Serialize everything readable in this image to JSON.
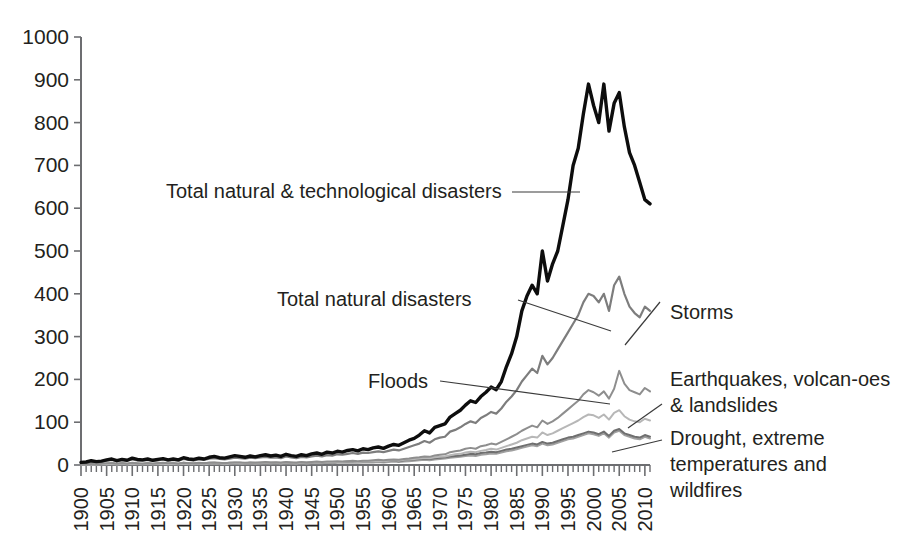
{
  "chart_data": {
    "type": "line",
    "title": "",
    "xlabel": "",
    "ylabel": "",
    "ylim": [
      0,
      1000
    ],
    "xlim": [
      1900,
      2011
    ],
    "grid": false,
    "legend_position": "inline-annotations",
    "ytick_labels": [
      "0",
      "100",
      "200",
      "300",
      "400",
      "500",
      "600",
      "700",
      "800",
      "900",
      "1000"
    ],
    "ytick_values": [
      0,
      100,
      200,
      300,
      400,
      500,
      600,
      700,
      800,
      900,
      1000
    ],
    "xtick_labels": [
      "1900",
      "1905",
      "1910",
      "1915",
      "1920",
      "1925",
      "1930",
      "1935",
      "1940",
      "1945",
      "1950",
      "1955",
      "1960",
      "1965",
      "1970",
      "1975",
      "1980",
      "1985",
      "1990",
      "1995",
      "2000",
      "2005",
      "2010"
    ],
    "xtick_values": [
      1900,
      1905,
      1910,
      1915,
      1920,
      1925,
      1930,
      1935,
      1940,
      1945,
      1950,
      1955,
      1960,
      1965,
      1970,
      1975,
      1980,
      1985,
      1990,
      1995,
      2000,
      2005,
      2010
    ],
    "x": [
      1900,
      1901,
      1902,
      1903,
      1904,
      1905,
      1906,
      1907,
      1908,
      1909,
      1910,
      1911,
      1912,
      1913,
      1914,
      1915,
      1916,
      1917,
      1918,
      1919,
      1920,
      1921,
      1922,
      1923,
      1924,
      1925,
      1926,
      1927,
      1928,
      1929,
      1930,
      1931,
      1932,
      1933,
      1934,
      1935,
      1936,
      1937,
      1938,
      1939,
      1940,
      1941,
      1942,
      1943,
      1944,
      1945,
      1946,
      1947,
      1948,
      1949,
      1950,
      1951,
      1952,
      1953,
      1954,
      1955,
      1956,
      1957,
      1958,
      1959,
      1960,
      1961,
      1962,
      1963,
      1964,
      1965,
      1966,
      1967,
      1968,
      1969,
      1970,
      1971,
      1972,
      1973,
      1974,
      1975,
      1976,
      1977,
      1978,
      1979,
      1980,
      1981,
      1982,
      1983,
      1984,
      1985,
      1986,
      1987,
      1988,
      1989,
      1990,
      1991,
      1992,
      1993,
      1994,
      1995,
      1996,
      1997,
      1998,
      1999,
      2000,
      2001,
      2002,
      2003,
      2004,
      2005,
      2006,
      2007,
      2008,
      2009,
      2010,
      2011
    ],
    "series": [
      {
        "name": "Total natural & technological disasters",
        "color": "#0d0d0d",
        "width": 3.4,
        "values": [
          6,
          7,
          10,
          8,
          9,
          12,
          14,
          10,
          13,
          11,
          16,
          13,
          12,
          14,
          11,
          13,
          15,
          12,
          14,
          12,
          17,
          14,
          13,
          16,
          14,
          18,
          20,
          17,
          16,
          19,
          22,
          20,
          18,
          21,
          19,
          22,
          24,
          21,
          23,
          20,
          25,
          22,
          20,
          24,
          22,
          26,
          28,
          25,
          30,
          28,
          32,
          30,
          34,
          36,
          33,
          38,
          36,
          40,
          42,
          39,
          44,
          48,
          46,
          52,
          58,
          62,
          70,
          80,
          75,
          88,
          92,
          96,
          112,
          120,
          128,
          140,
          150,
          146,
          160,
          170,
          182,
          176,
          195,
          230,
          260,
          300,
          360,
          395,
          420,
          400,
          500,
          430,
          470,
          500,
          560,
          620,
          700,
          740,
          820,
          890,
          840,
          800,
          890,
          780,
          845,
          870,
          790,
          730,
          700,
          660,
          620,
          610
        ]
      },
      {
        "name": "Total natural disasters",
        "color": "#7d7d7d",
        "width": 2.2,
        "values": [
          5,
          6,
          8,
          7,
          8,
          10,
          12,
          9,
          11,
          10,
          13,
          11,
          10,
          12,
          10,
          11,
          13,
          10,
          12,
          10,
          14,
          12,
          11,
          13,
          12,
          15,
          16,
          14,
          13,
          15,
          17,
          16,
          15,
          17,
          16,
          18,
          19,
          17,
          18,
          16,
          20,
          18,
          16,
          19,
          18,
          20,
          22,
          20,
          23,
          22,
          25,
          24,
          26,
          28,
          26,
          29,
          28,
          30,
          32,
          30,
          33,
          36,
          34,
          38,
          42,
          46,
          50,
          56,
          52,
          60,
          64,
          66,
          78,
          82,
          88,
          96,
          102,
          98,
          110,
          116,
          124,
          120,
          132,
          148,
          160,
          175,
          195,
          210,
          225,
          215,
          255,
          235,
          250,
          270,
          290,
          310,
          330,
          350,
          380,
          400,
          395,
          380,
          400,
          360,
          420,
          440,
          400,
          370,
          355,
          345,
          370,
          360
        ]
      },
      {
        "name": "Floods",
        "color": "#8e8e8e",
        "width": 2.0,
        "values": [
          2,
          2,
          3,
          2,
          3,
          4,
          4,
          3,
          4,
          3,
          5,
          4,
          3,
          4,
          3,
          4,
          5,
          4,
          4,
          3,
          5,
          4,
          4,
          5,
          4,
          5,
          6,
          5,
          4,
          5,
          6,
          6,
          5,
          6,
          5,
          6,
          7,
          6,
          6,
          5,
          7,
          6,
          5,
          7,
          6,
          7,
          8,
          7,
          8,
          8,
          9,
          8,
          9,
          10,
          9,
          10,
          10,
          11,
          12,
          11,
          12,
          13,
          12,
          14,
          15,
          17,
          18,
          20,
          19,
          22,
          24,
          25,
          30,
          32,
          34,
          38,
          40,
          38,
          44,
          46,
          50,
          48,
          54,
          60,
          66,
          72,
          80,
          86,
          92,
          88,
          104,
          96,
          102,
          110,
          120,
          130,
          140,
          150,
          165,
          175,
          170,
          162,
          172,
          155,
          178,
          220,
          190,
          175,
          170,
          165,
          180,
          172
        ]
      },
      {
        "name": "Storms",
        "color": "#b7b7b7",
        "width": 2.0,
        "values": [
          1,
          1,
          2,
          1,
          2,
          2,
          3,
          2,
          3,
          2,
          3,
          3,
          2,
          3,
          2,
          3,
          3,
          2,
          3,
          2,
          4,
          3,
          3,
          4,
          3,
          4,
          4,
          4,
          3,
          4,
          5,
          4,
          4,
          5,
          4,
          5,
          5,
          5,
          5,
          4,
          6,
          5,
          4,
          5,
          5,
          6,
          6,
          6,
          7,
          6,
          7,
          7,
          8,
          8,
          7,
          8,
          8,
          9,
          9,
          9,
          10,
          11,
          10,
          12,
          13,
          14,
          15,
          17,
          16,
          18,
          19,
          20,
          23,
          25,
          26,
          29,
          31,
          30,
          33,
          35,
          38,
          36,
          40,
          44,
          48,
          52,
          58,
          62,
          66,
          64,
          76,
          70,
          74,
          80,
          86,
          92,
          98,
          104,
          112,
          118,
          116,
          110,
          118,
          106,
          122,
          128,
          114,
          106,
          102,
          100,
          108,
          104
        ]
      },
      {
        "name": "Earthquakes, volcan-oes & landslides",
        "color": "#6f6f6f",
        "width": 2.0,
        "values": [
          2,
          2,
          3,
          2,
          3,
          3,
          4,
          3,
          4,
          3,
          4,
          3,
          3,
          4,
          3,
          4,
          4,
          3,
          4,
          3,
          5,
          4,
          3,
          4,
          4,
          5,
          5,
          4,
          4,
          5,
          5,
          5,
          4,
          5,
          5,
          5,
          6,
          5,
          6,
          5,
          6,
          5,
          5,
          6,
          5,
          6,
          7,
          6,
          7,
          6,
          7,
          7,
          8,
          8,
          7,
          8,
          8,
          9,
          9,
          8,
          10,
          10,
          9,
          11,
          12,
          13,
          14,
          15,
          14,
          16,
          17,
          18,
          20,
          21,
          22,
          24,
          26,
          25,
          28,
          29,
          31,
          30,
          33,
          36,
          38,
          41,
          44,
          47,
          50,
          48,
          54,
          50,
          52,
          56,
          60,
          64,
          66,
          70,
          74,
          78,
          76,
          72,
          78,
          68,
          80,
          84,
          74,
          70,
          66,
          64,
          70,
          66
        ]
      },
      {
        "name": "Drought, extreme temperatures and wildfires",
        "color": "#a0a0a0",
        "width": 2.0,
        "values": [
          1,
          1,
          1,
          1,
          2,
          2,
          2,
          1,
          2,
          2,
          2,
          2,
          2,
          2,
          2,
          2,
          2,
          2,
          2,
          2,
          3,
          2,
          2,
          3,
          2,
          3,
          3,
          3,
          2,
          3,
          3,
          3,
          3,
          3,
          3,
          3,
          4,
          3,
          4,
          3,
          4,
          3,
          3,
          4,
          3,
          4,
          4,
          4,
          5,
          4,
          5,
          5,
          5,
          6,
          5,
          6,
          6,
          6,
          7,
          6,
          7,
          8,
          7,
          8,
          9,
          10,
          11,
          12,
          11,
          13,
          14,
          15,
          17,
          18,
          19,
          21,
          22,
          21,
          24,
          25,
          27,
          26,
          29,
          32,
          34,
          37,
          40,
          43,
          46,
          44,
          50,
          46,
          48,
          52,
          56,
          60,
          62,
          66,
          70,
          74,
          72,
          68,
          74,
          64,
          76,
          80,
          70,
          66,
          62,
          60,
          66,
          62
        ]
      }
    ],
    "annotations": [
      {
        "id": "total-nat-tech",
        "text": "Total natural & technological disasters"
      },
      {
        "id": "total-natural",
        "text": "Total natural disasters"
      },
      {
        "id": "storms",
        "text": "Storms"
      },
      {
        "id": "floods",
        "text": "Floods"
      },
      {
        "id": "earthquakes-line1",
        "text": "Earthquakes, volcan-oes"
      },
      {
        "id": "earthquakes-line2",
        "text": "& landslides"
      },
      {
        "id": "drought-line1",
        "text": "Drought, extreme"
      },
      {
        "id": "drought-line2",
        "text": "temperatures and"
      },
      {
        "id": "drought-line3",
        "text": "wildfires"
      }
    ]
  }
}
